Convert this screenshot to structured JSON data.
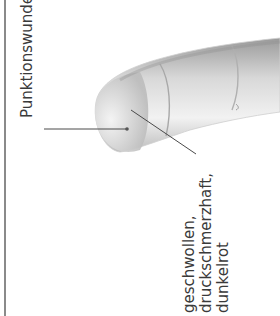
{
  "figure": {
    "labels": {
      "puncture": "Punktionswunde",
      "swollen": {
        "line1": "geschwollen,",
        "line2": "druckschmerzhaft,",
        "line3": "dunkelrot"
      }
    },
    "colors": {
      "text": "#3a3a3a",
      "rule": "#8a8a8a",
      "leader": "#4a4a4a"
    }
  }
}
